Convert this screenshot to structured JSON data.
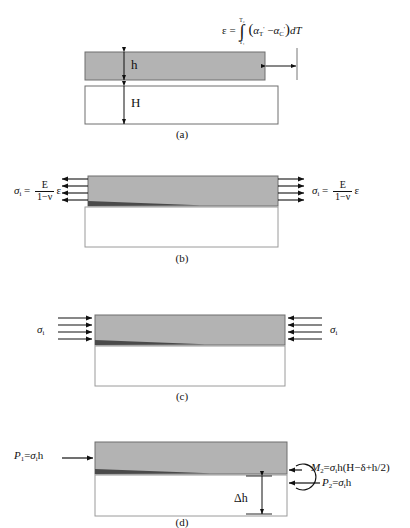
{
  "figure": {
    "colors": {
      "coating_fill": "#b3b3b3",
      "substrate_fill": "#ffffff",
      "outline": "#6e6e6e",
      "dark_outline": "#3a3a3a",
      "arrow": "#111111",
      "text": "#111111"
    }
  },
  "panels": [
    {
      "id": "a",
      "caption": "(a)",
      "labels": {
        "coating_thickness": "h",
        "substrate_thickness": "H"
      },
      "equation": {
        "lhs": "ε",
        "equals": "=",
        "integral_lower": "T₁",
        "integral_upper": "T₂",
        "integrand_open": "(",
        "alpha_1": "α",
        "alpha_1_sub": "T",
        "alpha_1_sup": "'",
        "minus": "−",
        "alpha_2": "α",
        "alpha_2_sub": "C",
        "alpha_2_sup": "'",
        "integrand_close": ")",
        "differential": "dT",
        "plain": "ε = ∫(T₁..T₂) (αT' − αC') dT"
      }
    },
    {
      "id": "b",
      "caption": "(b)",
      "equation_left": {
        "sigma": "σ",
        "sigma_sub": "i",
        "equals": "=",
        "numerator": "E",
        "denominator": "1−ν",
        "strain": "ε",
        "plain": "σi = E/(1−ν) ε"
      },
      "equation_right": {
        "sigma": "σ",
        "sigma_sub": "i",
        "equals": "=",
        "numerator": "E",
        "denominator": "1−ν",
        "strain": "ε",
        "plain": "σi = E/(1−ν) ε"
      }
    },
    {
      "id": "c",
      "caption": "(c)",
      "label_left": {
        "sigma": "σ",
        "sigma_sub": "i",
        "plain": "σi"
      },
      "label_right": {
        "sigma": "σ",
        "sigma_sub": "i",
        "plain": "σi"
      }
    },
    {
      "id": "d",
      "caption": "(d)",
      "label_left": {
        "symbol": "P",
        "symbol_sub": "1",
        "equals": "=",
        "expr": "σ",
        "expr_sub": "i",
        "tail": "h",
        "plain": "P₁=σih"
      },
      "label_moment": {
        "symbol": "M",
        "symbol_sub": "2",
        "equals": "=",
        "expr": "σ",
        "expr_sub": "i",
        "tail": "h(H−δ+h/2)",
        "plain": "M₂=σih(H−δ+h/2)"
      },
      "label_force": {
        "symbol": "P",
        "symbol_sub": "2",
        "equals": "=",
        "expr": "σ",
        "expr_sub": "i",
        "tail": "h",
        "plain": "P₂=σih"
      },
      "label_deflection": {
        "text": "Δh"
      }
    }
  ]
}
